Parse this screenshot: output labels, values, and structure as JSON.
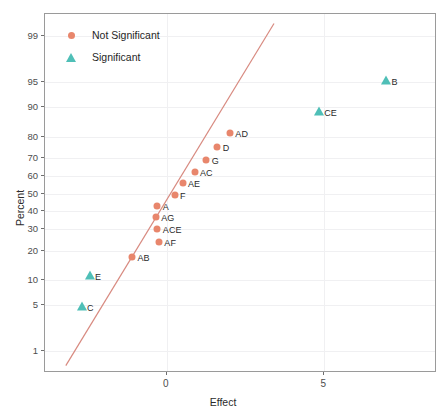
{
  "chart_data": {
    "type": "scatter",
    "title": "",
    "xlabel": "Effect",
    "ylabel": "Percent",
    "xlim": [
      -3.86,
      8.57
    ],
    "ylim_percent": [
      0.4,
      99.6
    ],
    "grid": true,
    "legend_position": "top-left",
    "x_ticks": [
      {
        "label": "0",
        "value": 0
      },
      {
        "label": "5",
        "value": 5
      }
    ],
    "y_ticks": [
      {
        "label": "1",
        "value": 1
      },
      {
        "label": "5",
        "value": 5
      },
      {
        "label": "10",
        "value": 10
      },
      {
        "label": "20",
        "value": 20
      },
      {
        "label": "30",
        "value": 30
      },
      {
        "label": "40",
        "value": 40
      },
      {
        "label": "50",
        "value": 50
      },
      {
        "label": "60",
        "value": 60
      },
      {
        "label": "70",
        "value": 70
      },
      {
        "label": "80",
        "value": 80
      },
      {
        "label": "90",
        "value": 90
      },
      {
        "label": "95",
        "value": 95
      },
      {
        "label": "99",
        "value": 99
      }
    ],
    "legend": [
      {
        "name": "Not Significant",
        "marker": "circle",
        "color": "#E8866C"
      },
      {
        "name": "Significant",
        "marker": "triangle",
        "color": "#4FBFB7"
      }
    ],
    "reference_line": {
      "color": "#D88A80",
      "x_start": -3.2,
      "y_start_percent": 0.55,
      "x_end": 3.4,
      "y_end_percent": 99.4
    },
    "series": [
      {
        "name": "Not Significant",
        "marker": "circle",
        "color": "#E8866C",
        "points": [
          {
            "label": "AB",
            "x": -1.1,
            "percent": 17.3
          },
          {
            "label": "AF",
            "x": -0.25,
            "percent": 23.8
          },
          {
            "label": "ACE",
            "x": -0.3,
            "percent": 30.0
          },
          {
            "label": "AG",
            "x": -0.35,
            "percent": 36.5
          },
          {
            "label": "A",
            "x": -0.3,
            "percent": 42.9
          },
          {
            "label": "F",
            "x": 0.25,
            "percent": 49.4
          },
          {
            "label": "AE",
            "x": 0.5,
            "percent": 56.0
          },
          {
            "label": "AC",
            "x": 0.88,
            "percent": 62.3
          },
          {
            "label": "G",
            "x": 1.25,
            "percent": 68.8
          },
          {
            "label": "D",
            "x": 1.6,
            "percent": 75.2
          },
          {
            "label": "AD",
            "x": 2.0,
            "percent": 81.5
          }
        ]
      },
      {
        "name": "Significant",
        "marker": "triangle",
        "color": "#4FBFB7",
        "points": [
          {
            "label": "C",
            "x": -2.7,
            "percent": 4.7
          },
          {
            "label": "E",
            "x": -2.45,
            "percent": 11.1
          },
          {
            "label": "CE",
            "x": 4.82,
            "percent": 88.7
          },
          {
            "label": "B",
            "x": 6.95,
            "percent": 95.2
          }
        ]
      }
    ]
  }
}
